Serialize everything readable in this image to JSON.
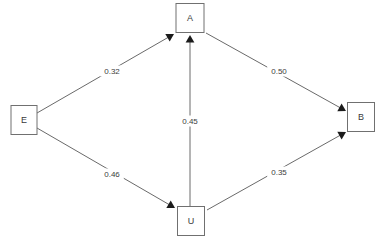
{
  "diagram": {
    "type": "path-diagram",
    "background_color": "#ffffff",
    "node_stroke_color": "#707070",
    "node_fill_color": "#ffffff",
    "edge_color": "#6a6a6a",
    "arrowhead_color": "#1b1b1b",
    "label_color": "#3c3c3c",
    "nodes": [
      {
        "id": "A",
        "label": "A",
        "x": 190,
        "y": 18,
        "w": 28,
        "h": 29
      },
      {
        "id": "E",
        "label": "E",
        "x": 24,
        "y": 120,
        "w": 26,
        "h": 29
      },
      {
        "id": "B",
        "label": "B",
        "x": 361,
        "y": 117,
        "w": 27,
        "h": 29
      },
      {
        "id": "U",
        "label": "U",
        "x": 191,
        "y": 221,
        "w": 27,
        "h": 29
      }
    ],
    "edges": [
      {
        "id": "E-A",
        "from": "E",
        "to": "A",
        "label": "0.32",
        "label_x": 112,
        "label_y": 71,
        "x1": 37,
        "y1": 113,
        "x2": 174,
        "y2": 34,
        "directed": true
      },
      {
        "id": "E-U",
        "from": "E",
        "to": "U",
        "label": "0.46",
        "label_x": 112,
        "label_y": 174,
        "x1": 37,
        "y1": 128,
        "x2": 175,
        "y2": 208,
        "directed": true
      },
      {
        "id": "U-A",
        "from": "U",
        "to": "A",
        "label": "0.45",
        "label_x": 190,
        "label_y": 121,
        "x1": 190,
        "y1": 206,
        "x2": 190,
        "y2": 35,
        "directed": true
      },
      {
        "id": "A-B",
        "from": "A",
        "to": "B",
        "label": "0.50",
        "label_x": 279,
        "label_y": 71,
        "x1": 206,
        "y1": 33,
        "x2": 346,
        "y2": 111,
        "directed": true
      },
      {
        "id": "U-B",
        "from": "U",
        "to": "B",
        "label": "0.35",
        "label_x": 279,
        "label_y": 172,
        "x1": 207,
        "y1": 210,
        "x2": 346,
        "y2": 132,
        "directed": true
      }
    ]
  }
}
